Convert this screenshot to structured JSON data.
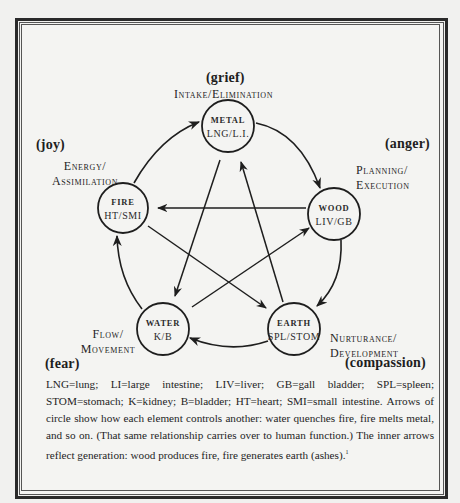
{
  "diagram": {
    "nodes": [
      {
        "id": "metal",
        "element": "METAL",
        "organs": "LNG/L.I.",
        "emotion": "(grief)",
        "function_line1": "Intake/Elimination",
        "function_line2": ""
      },
      {
        "id": "wood",
        "element": "WOOD",
        "organs": "LIV/GB",
        "emotion": "(anger)",
        "function_line1": "Planning/",
        "function_line2": "Execution"
      },
      {
        "id": "earth",
        "element": "EARTH",
        "organs": "SPL/STOM",
        "emotion": "(compassion)",
        "function_line1": "Nurturance/",
        "function_line2": "Development"
      },
      {
        "id": "water",
        "element": "WATER",
        "organs": "K/B",
        "emotion": "(fear)",
        "function_line1": "Flow/",
        "function_line2": "Movement"
      },
      {
        "id": "fire",
        "element": "FIRE",
        "organs": "HT/SMI",
        "emotion": "(joy)",
        "function_line1": "Energy/",
        "function_line2": "Assimilation"
      }
    ],
    "outer_arrows": [
      {
        "from": "fire",
        "to": "metal"
      },
      {
        "from": "metal",
        "to": "wood"
      },
      {
        "from": "wood",
        "to": "earth"
      },
      {
        "from": "earth",
        "to": "water"
      },
      {
        "from": "water",
        "to": "fire"
      }
    ],
    "inner_arrows": [
      {
        "from": "wood",
        "to": "fire"
      },
      {
        "from": "fire",
        "to": "earth"
      },
      {
        "from": "earth",
        "to": "metal"
      },
      {
        "from": "metal",
        "to": "water"
      },
      {
        "from": "water",
        "to": "wood"
      }
    ]
  },
  "caption": {
    "text": "LNG=lung; LI=large intestine; LIV=liver; GB=gall bladder; SPL=spleen; STOM=stomach; K=kidney; B=bladder; HT=heart; SMI=small intestine. Arrows of circle show how each element controls another: water quenches fire, fire melts metal, and so on. (That same relationship carries over to human function.) The inner arrows reflect generation: wood produces fire, fire generates earth (ashes).",
    "footnote_mark": "1"
  },
  "colors": {
    "page": "#f1f1ef",
    "ink": "#1e1e1e",
    "frame": "#2a2a2a"
  }
}
